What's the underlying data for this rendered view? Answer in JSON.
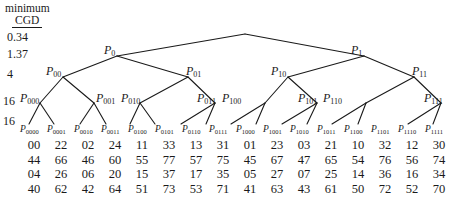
{
  "figure": {
    "type": "binary-tree-diagram",
    "column_header_line1": "minimum",
    "column_header_line2": "CGD",
    "cgd_values": [
      "0.34",
      "1.37",
      "4",
      "16",
      "16"
    ]
  },
  "tree": {
    "root": {
      "label": "",
      "sub": ""
    },
    "level1": [
      {
        "label": "P",
        "sub": "0"
      },
      {
        "label": "P",
        "sub": "1"
      }
    ],
    "level2": [
      {
        "label": "P",
        "sub": "00"
      },
      {
        "label": "P",
        "sub": "01"
      },
      {
        "label": "P",
        "sub": "10"
      },
      {
        "label": "P",
        "sub": "11"
      }
    ],
    "level3": [
      {
        "label": "P",
        "sub": "000"
      },
      {
        "label": "P",
        "sub": "001"
      },
      {
        "label": "P",
        "sub": "010"
      },
      {
        "label": "P",
        "sub": "011"
      },
      {
        "label": "P",
        "sub": "100"
      },
      {
        "label": "P",
        "sub": "101"
      },
      {
        "label": "P",
        "sub": "110"
      },
      {
        "label": "P",
        "sub": "111"
      }
    ],
    "leaves": [
      {
        "label": "P",
        "sub": "0000"
      },
      {
        "label": "P",
        "sub": "0001"
      },
      {
        "label": "P",
        "sub": "0010"
      },
      {
        "label": "P",
        "sub": "0011"
      },
      {
        "label": "P",
        "sub": "0100"
      },
      {
        "label": "P",
        "sub": "0101"
      },
      {
        "label": "P",
        "sub": "0110"
      },
      {
        "label": "P",
        "sub": "0111"
      },
      {
        "label": "P",
        "sub": "1000"
      },
      {
        "label": "P",
        "sub": "1001"
      },
      {
        "label": "P",
        "sub": "1010"
      },
      {
        "label": "P",
        "sub": "1011"
      },
      {
        "label": "P",
        "sub": "1100"
      },
      {
        "label": "P",
        "sub": "1101"
      },
      {
        "label": "P",
        "sub": "1110"
      },
      {
        "label": "P",
        "sub": "1111"
      }
    ]
  },
  "chart_data": {
    "type": "table",
    "title": "",
    "columns": [
      "P0000",
      "P0001",
      "P0010",
      "P0011",
      "P0100",
      "P0101",
      "P0110",
      "P0111",
      "P1000",
      "P1001",
      "P1010",
      "P1011",
      "P1100",
      "P1101",
      "P1110",
      "P1111"
    ],
    "rows": [
      [
        "00",
        "22",
        "02",
        "24",
        "11",
        "33",
        "13",
        "31",
        "01",
        "23",
        "03",
        "21",
        "10",
        "32",
        "12",
        "30"
      ],
      [
        "44",
        "66",
        "46",
        "60",
        "55",
        "77",
        "57",
        "75",
        "45",
        "67",
        "47",
        "65",
        "54",
        "76",
        "56",
        "74"
      ],
      [
        "04",
        "26",
        "06",
        "20",
        "15",
        "37",
        "17",
        "35",
        "05",
        "27",
        "07",
        "25",
        "14",
        "36",
        "16",
        "34"
      ],
      [
        "40",
        "62",
        "42",
        "64",
        "51",
        "73",
        "53",
        "71",
        "41",
        "63",
        "43",
        "61",
        "50",
        "72",
        "52",
        "70"
      ]
    ]
  }
}
